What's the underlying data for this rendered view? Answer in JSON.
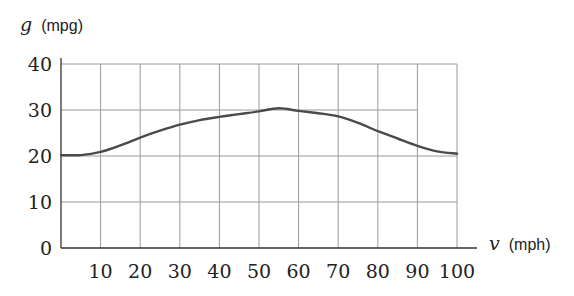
{
  "chart_data": {
    "type": "line",
    "title": "",
    "xlabel": "v (mph)",
    "ylabel": "g (mpg)",
    "xlabel_var": "v",
    "xlabel_unit": "(mph)",
    "ylabel_var": "g",
    "ylabel_unit": "(mpg)",
    "xlim": [
      0,
      105
    ],
    "ylim": [
      0,
      40
    ],
    "x_ticks": [
      10,
      20,
      30,
      40,
      50,
      60,
      70,
      80,
      90,
      100
    ],
    "y_ticks": [
      0,
      10,
      20,
      30,
      40
    ],
    "grid": true,
    "legend": null,
    "series": [
      {
        "name": "fuel efficiency g(v)",
        "x": [
          0,
          5,
          10,
          15,
          20,
          25,
          30,
          35,
          40,
          45,
          50,
          55,
          60,
          65,
          70,
          75,
          80,
          85,
          90,
          95,
          100
        ],
        "y": [
          20.2,
          20.2,
          20.9,
          22.3,
          24.0,
          25.5,
          26.8,
          27.8,
          28.5,
          29.1,
          29.7,
          30.4,
          29.8,
          29.3,
          28.6,
          27.2,
          25.4,
          23.8,
          22.2,
          21.0,
          20.5
        ]
      }
    ],
    "color": "#4a4a4a"
  },
  "layout": {
    "origin_px": [
      61,
      248
    ],
    "px_per_x_unit": 3.96,
    "px_per_y_unit": 4.6,
    "x_axis_end_px": 477,
    "grid_right_x": 100,
    "gridline_30_right_x": 90
  }
}
